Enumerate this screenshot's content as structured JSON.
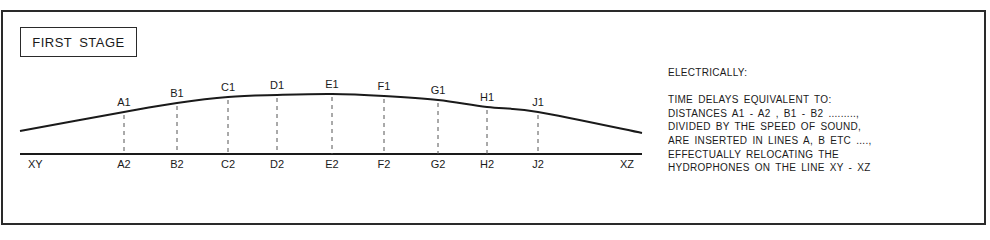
{
  "title": "FIRST STAGE",
  "diagram": {
    "baseline": {
      "x1": 20,
      "x2": 642,
      "y": 154,
      "left_label": "XY",
      "right_label": "XZ"
    },
    "curve_points": [
      [
        20,
        131
      ],
      [
        124,
        112
      ],
      [
        177,
        103
      ],
      [
        228,
        97
      ],
      [
        277,
        95
      ],
      [
        332,
        94
      ],
      [
        384,
        96
      ],
      [
        438,
        100
      ],
      [
        487,
        107
      ],
      [
        538,
        112
      ],
      [
        642,
        133
      ]
    ],
    "hydrophones": [
      {
        "id": "A",
        "top_label": "A1",
        "bottom_label": "A2",
        "x": 124,
        "curve_y": 112
      },
      {
        "id": "B",
        "top_label": "B1",
        "bottom_label": "B2",
        "x": 177,
        "curve_y": 103
      },
      {
        "id": "C",
        "top_label": "C1",
        "bottom_label": "C2",
        "x": 228,
        "curve_y": 97
      },
      {
        "id": "D",
        "top_label": "D1",
        "bottom_label": "D2",
        "x": 277,
        "curve_y": 95
      },
      {
        "id": "E",
        "top_label": "E1",
        "bottom_label": "E2",
        "x": 332,
        "curve_y": 94
      },
      {
        "id": "F",
        "top_label": "F1",
        "bottom_label": "F2",
        "x": 384,
        "curve_y": 96
      },
      {
        "id": "G",
        "top_label": "G1",
        "bottom_label": "G2",
        "x": 438,
        "curve_y": 100
      },
      {
        "id": "H",
        "top_label": "H1",
        "bottom_label": "H2",
        "x": 487,
        "curve_y": 107
      },
      {
        "id": "J",
        "top_label": "J1",
        "bottom_label": "J2",
        "x": 538,
        "curve_y": 112
      }
    ]
  },
  "notes": {
    "heading": "ELECTRICALLY:",
    "lines": [
      "TIME DELAYS EQUIVALENT TO:",
      "DISTANCES A1 - A2 , B1 - B2 .........,",
      "DIVIDED BY THE SPEED OF SOUND,",
      "ARE INSERTED IN LINES A, B ETC ....,",
      "EFFECTUALLY RELOCATING THE",
      "HYDROPHONES ON THE LINE XY - XZ"
    ]
  },
  "colors": {
    "ink": "#1a1a1a",
    "border": "#2a2a2a",
    "dash": "#555555",
    "background": "#ffffff"
  }
}
